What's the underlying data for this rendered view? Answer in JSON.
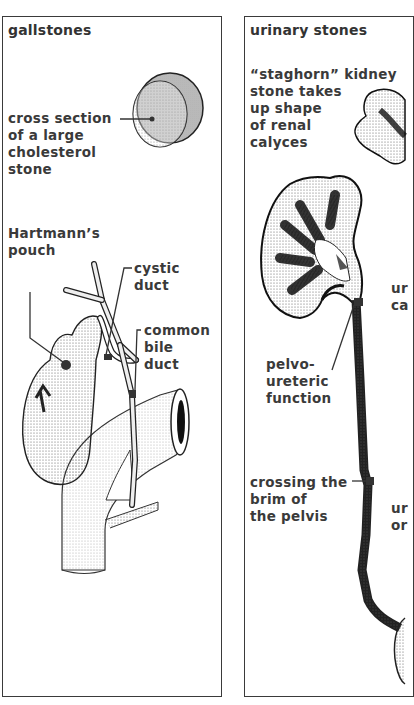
{
  "panels": [
    {
      "title": "gallstones",
      "labels": {
        "cross_section": "cross section\nof a large\ncholesterol\nstone",
        "hartmann": "Hartmann’s\npouch",
        "cystic_duct": "cystic\nduct",
        "common_bile_duct": "common\nbile\nduct"
      }
    },
    {
      "title": "urinary stones",
      "labels": {
        "staghorn": "“staghorn” kidney\nstone takes\nup shape\nof renal\ncalyces",
        "pelvo": "pelvo-\nureteric\nfunction",
        "crossing": "crossing the\nbrim of\nthe pelvis",
        "clipped_1": "ur\nca",
        "clipped_2": "ur\nor"
      }
    }
  ],
  "colors": {
    "ink": "#2e2e2e",
    "border": "#3a3a3a",
    "stipple": "#555555",
    "background": "#ffffff"
  }
}
